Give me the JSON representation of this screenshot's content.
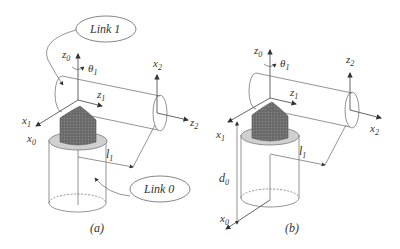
{
  "figure_a": {
    "caption": "(a)",
    "callout_link1": "Link 1",
    "callout_link0": "Link 0",
    "labels": {
      "z0": "z",
      "z0_sub": "0",
      "theta1": "θ",
      "theta1_sub": "1",
      "x2": "x",
      "x2_sub": "2",
      "z1": "z",
      "z1_sub": "1",
      "z2": "z",
      "z2_sub": "2",
      "x1": "x",
      "x1_sub": "1",
      "x0": "x",
      "x0_sub": "0",
      "l1": "l",
      "l1_sub": "1"
    }
  },
  "figure_b": {
    "caption": "(b)",
    "labels": {
      "z0": "z",
      "z0_sub": "0",
      "theta1": "θ",
      "theta1_sub": "1",
      "z2": "z",
      "z2_sub": "2",
      "z1": "z",
      "z1_sub": "1",
      "x2": "x",
      "x2_sub": "2",
      "x1": "x",
      "x1_sub": "1",
      "l1": "l",
      "l1_sub": "1",
      "d0": "d",
      "d0_sub": "0",
      "x0": "x",
      "x0_sub": "0"
    }
  },
  "colors": {
    "joint_dark": "#6e6e6e",
    "collar_light": "#d0d0d0",
    "line": "#555555"
  }
}
